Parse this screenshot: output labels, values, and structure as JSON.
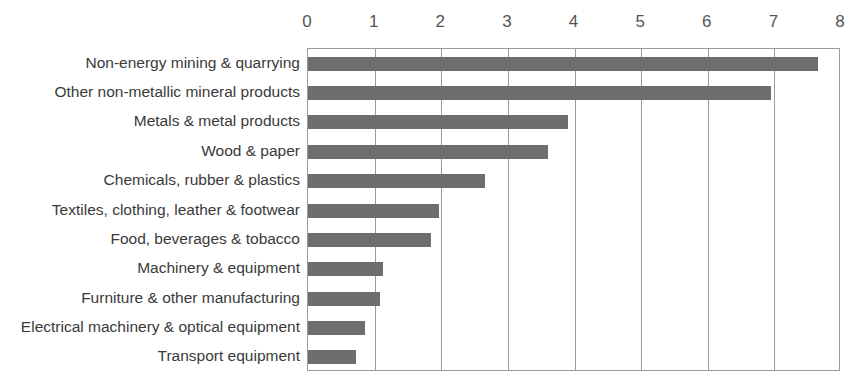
{
  "chart_data": {
    "type": "bar",
    "orientation": "horizontal",
    "title": "",
    "subtitle": "",
    "xlabel": "",
    "ylabel": "",
    "xlim": [
      0,
      8
    ],
    "ylim": null,
    "xticks": [
      "0",
      "1",
      "2",
      "3",
      "4",
      "5",
      "6",
      "7",
      "8"
    ],
    "grid": "vertical",
    "legend": null,
    "legend_position": "none",
    "categories": [
      "Non-energy mining & quarrying",
      "Other non-metallic mineral products",
      "Metals & metal products",
      "Wood & paper",
      "Chemicals, rubber & plastics",
      "Textiles, clothing, leather & footwear",
      "Food, beverages & tobacco",
      "Machinery & equipment",
      "Furniture & other manufacturing",
      "Electrical machinery & optical equipment",
      "Transport equipment"
    ],
    "values": [
      7.65,
      6.95,
      3.9,
      3.6,
      2.65,
      1.97,
      1.85,
      1.12,
      1.08,
      0.85,
      0.72
    ],
    "colors": {
      "bar": "#6e6e6e",
      "axis": "#9a9a9a",
      "gridline": "#9a9a9a",
      "label_text": "#3a3a3a",
      "tick_text": "#555555",
      "background": "#ffffff"
    }
  }
}
